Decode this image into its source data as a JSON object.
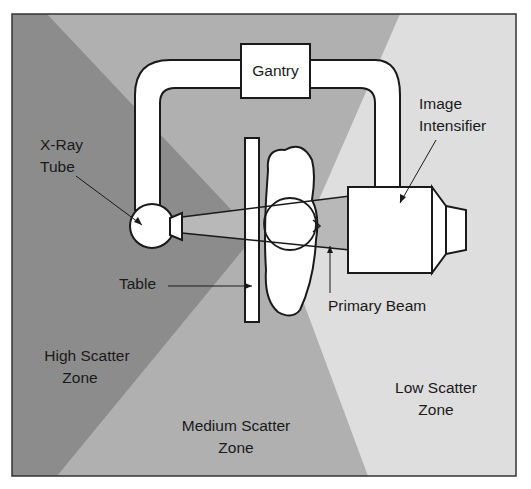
{
  "diagram": {
    "colors": {
      "high_zone": "#8c8c8c",
      "medium_zone": "#b0b0b0",
      "low_zone": "#dedede",
      "beam": "#b8b8b8",
      "equipment_fill": "#ffffff",
      "outline": "#1a1a1a"
    },
    "labels": {
      "gantry": "Gantry",
      "xray_tube_line1": "X-Ray",
      "xray_tube_line2": "Tube",
      "image_intensifier_line1": "Image",
      "image_intensifier_line2": "Intensifier",
      "table": "Table",
      "primary_beam": "Primary Beam",
      "high_zone_line1": "High Scatter",
      "high_zone_line2": "Zone",
      "medium_zone_line1": "Medium Scatter",
      "medium_zone_line2": "Zone",
      "low_zone_line1": "Low Scatter",
      "low_zone_line2": "Zone"
    },
    "nodes": [
      "Gantry",
      "X-Ray Tube",
      "Image Intensifier",
      "Table",
      "Patient",
      "Primary Beam"
    ],
    "zones": [
      "High Scatter Zone",
      "Medium Scatter Zone",
      "Low Scatter Zone"
    ],
    "edges": [
      {
        "from": "X-Ray Tube",
        "to": "Image Intensifier",
        "via": "Primary Beam"
      },
      {
        "from": "Gantry",
        "to": "X-Ray Tube",
        "type": "C-arm"
      },
      {
        "from": "Gantry",
        "to": "Image Intensifier",
        "type": "C-arm"
      }
    ]
  }
}
